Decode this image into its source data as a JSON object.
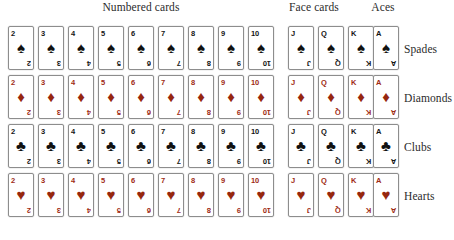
{
  "figure": {
    "background_color": "#ffffff"
  },
  "colors": {
    "black_suit": "#111111",
    "red_suit": "#96270f",
    "red_rank": "#9e2a14",
    "black_rank": "#141414",
    "card_border": "#8d8d8d",
    "card_face": "#ffffff",
    "label_text": "#2b2b2b"
  },
  "headers": [
    {
      "label": "Numbered cards",
      "center_x": 141,
      "group": "numbered"
    },
    {
      "label": "Face cards",
      "center_x": 314,
      "group": "face"
    },
    {
      "label": "Aces",
      "center_x": 383,
      "group": "aces"
    }
  ],
  "groups": {
    "numbered": {
      "label": "Numbered cards",
      "ranks": [
        "2",
        "3",
        "4",
        "5",
        "6",
        "7",
        "8",
        "9",
        "10"
      ]
    },
    "face": {
      "label": "Face cards",
      "ranks": [
        "J",
        "Q",
        "K"
      ]
    },
    "aces": {
      "label": "Aces",
      "ranks": [
        "A"
      ]
    }
  },
  "column_positions": [
    8,
    38,
    68,
    98,
    128,
    158,
    188,
    218,
    248,
    288,
    318,
    348,
    373
  ],
  "ranks": [
    "2",
    "3",
    "4",
    "5",
    "6",
    "7",
    "8",
    "9",
    "10",
    "J",
    "Q",
    "K",
    "A"
  ],
  "rows": [
    {
      "label": "Spades",
      "suit_key": "spades",
      "glyph": "♠",
      "glyph_name": "spade-suit-icon",
      "color_class": "black",
      "top": 26,
      "cards": [
        {
          "rank": "2",
          "group": "numbered"
        },
        {
          "rank": "3",
          "group": "numbered"
        },
        {
          "rank": "4",
          "group": "numbered"
        },
        {
          "rank": "5",
          "group": "numbered"
        },
        {
          "rank": "6",
          "group": "numbered"
        },
        {
          "rank": "7",
          "group": "numbered"
        },
        {
          "rank": "8",
          "group": "numbered"
        },
        {
          "rank": "9",
          "group": "numbered"
        },
        {
          "rank": "10",
          "group": "numbered"
        },
        {
          "rank": "J",
          "group": "face"
        },
        {
          "rank": "Q",
          "group": "face"
        },
        {
          "rank": "K",
          "group": "face"
        },
        {
          "rank": "A",
          "group": "aces"
        }
      ]
    },
    {
      "label": "Diamonds",
      "suit_key": "diamonds",
      "glyph": "♦",
      "glyph_name": "diamond-suit-icon",
      "color_class": "red",
      "top": 75,
      "cards": [
        {
          "rank": "2",
          "group": "numbered"
        },
        {
          "rank": "3",
          "group": "numbered"
        },
        {
          "rank": "4",
          "group": "numbered"
        },
        {
          "rank": "5",
          "group": "numbered"
        },
        {
          "rank": "6",
          "group": "numbered"
        },
        {
          "rank": "7",
          "group": "numbered"
        },
        {
          "rank": "8",
          "group": "numbered"
        },
        {
          "rank": "9",
          "group": "numbered"
        },
        {
          "rank": "10",
          "group": "numbered"
        },
        {
          "rank": "J",
          "group": "face"
        },
        {
          "rank": "Q",
          "group": "face"
        },
        {
          "rank": "K",
          "group": "face"
        },
        {
          "rank": "A",
          "group": "aces"
        }
      ]
    },
    {
      "label": "Clubs",
      "suit_key": "clubs",
      "glyph": "♣",
      "glyph_name": "club-suit-icon",
      "color_class": "black",
      "top": 124,
      "cards": [
        {
          "rank": "2",
          "group": "numbered"
        },
        {
          "rank": "3",
          "group": "numbered"
        },
        {
          "rank": "4",
          "group": "numbered"
        },
        {
          "rank": "5",
          "group": "numbered"
        },
        {
          "rank": "6",
          "group": "numbered"
        },
        {
          "rank": "7",
          "group": "numbered"
        },
        {
          "rank": "8",
          "group": "numbered"
        },
        {
          "rank": "9",
          "group": "numbered"
        },
        {
          "rank": "10",
          "group": "numbered"
        },
        {
          "rank": "J",
          "group": "face"
        },
        {
          "rank": "Q",
          "group": "face"
        },
        {
          "rank": "K",
          "group": "face"
        },
        {
          "rank": "A",
          "group": "aces"
        }
      ]
    },
    {
      "label": "Hearts",
      "suit_key": "hearts",
      "glyph": "♥",
      "glyph_name": "heart-suit-icon",
      "color_class": "red",
      "top": 173,
      "cards": [
        {
          "rank": "2",
          "group": "numbered"
        },
        {
          "rank": "3",
          "group": "numbered"
        },
        {
          "rank": "4",
          "group": "numbered"
        },
        {
          "rank": "5",
          "group": "numbered"
        },
        {
          "rank": "6",
          "group": "numbered"
        },
        {
          "rank": "7",
          "group": "numbered"
        },
        {
          "rank": "8",
          "group": "numbered"
        },
        {
          "rank": "9",
          "group": "numbered"
        },
        {
          "rank": "10",
          "group": "numbered"
        },
        {
          "rank": "J",
          "group": "face"
        },
        {
          "rank": "Q",
          "group": "face"
        },
        {
          "rank": "K",
          "group": "face"
        },
        {
          "rank": "A",
          "group": "aces"
        }
      ]
    }
  ]
}
